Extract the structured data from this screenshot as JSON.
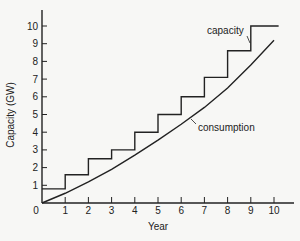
{
  "chart_data": {
    "type": "line",
    "title": "",
    "xlabel": "Year",
    "ylabel": "Capacity (GW)",
    "xlim": [
      0,
      10.5
    ],
    "ylim": [
      0,
      11
    ],
    "x_ticks": [
      "0",
      "1",
      "2",
      "3",
      "4",
      "5",
      "6",
      "7",
      "8",
      "9",
      "10"
    ],
    "y_ticks": [
      "1",
      "2",
      "3",
      "4",
      "5",
      "6",
      "7",
      "8",
      "9",
      "10"
    ],
    "grid": false,
    "legend": "inline annotations",
    "series": [
      {
        "name": "capacity",
        "style": "step",
        "x": [
          0,
          1,
          2,
          3,
          4,
          5,
          6,
          7,
          8,
          9,
          10.2
        ],
        "values": [
          0.8,
          1.6,
          2.5,
          3.0,
          4.0,
          5.0,
          6.0,
          7.1,
          8.6,
          10.0,
          10.0
        ]
      },
      {
        "name": "consumption",
        "style": "curve",
        "x": [
          0,
          1,
          2,
          3,
          4,
          5,
          6,
          7,
          8,
          9,
          10
        ],
        "values": [
          0,
          0.55,
          1.2,
          1.9,
          2.7,
          3.55,
          4.45,
          5.4,
          6.5,
          7.8,
          9.2
        ]
      }
    ],
    "annotations": [
      {
        "text": "capacity",
        "points_to": "capacity"
      },
      {
        "text": "consumption",
        "points_to": "consumption"
      }
    ]
  }
}
